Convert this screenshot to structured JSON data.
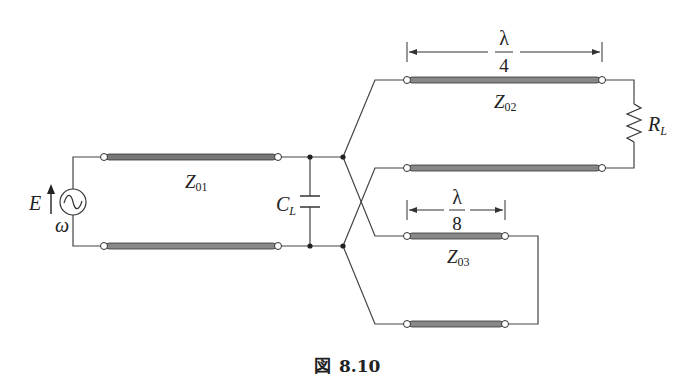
{
  "figure": {
    "caption_prefix": "図",
    "caption_number": "8.10"
  },
  "source": {
    "voltage_label": "E",
    "frequency_label": "ω"
  },
  "components": {
    "capacitor_label": "C",
    "capacitor_sub": "L",
    "resistor_label": "R",
    "resistor_sub": "L"
  },
  "lines": {
    "z01": {
      "label": "Z",
      "sub": "01"
    },
    "z02": {
      "label": "Z",
      "sub": "02",
      "length_num": "λ",
      "length_den": "4"
    },
    "z03": {
      "label": "Z",
      "sub": "03",
      "length_num": "λ",
      "length_den": "8"
    }
  },
  "colors": {
    "wire": "#444444",
    "line_fill": "#8a8a8a",
    "line_edge": "#333333"
  }
}
